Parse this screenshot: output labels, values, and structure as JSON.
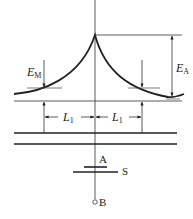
{
  "diagram": {
    "type": "potential-energy-curve-with-electrodes",
    "labels": {
      "E_M": {
        "main": "E",
        "sub": "M"
      },
      "E_A": {
        "main": "E",
        "sub": "A"
      },
      "L1_left": {
        "main": "L",
        "sub": "1"
      },
      "L1_right": {
        "main": "L",
        "sub": "1"
      },
      "A": "A",
      "S": "S",
      "B": "B"
    },
    "colors": {
      "stroke": "#222222",
      "background": "#ffffff"
    }
  }
}
